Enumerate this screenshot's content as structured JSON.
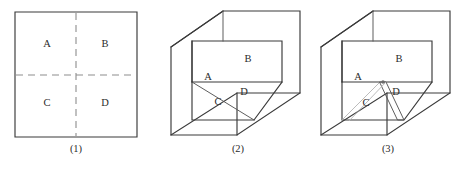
{
  "page": {
    "background_color": "#ffffff",
    "width": 468,
    "height": 169
  },
  "style": {
    "solid_stroke": "#3a3a3a",
    "thin_stroke": "#555555",
    "dashed_stroke": "#8d8d8d",
    "slit_stroke": "#b4b4b4",
    "label_color": "#2b2b2b"
  },
  "figures": [
    {
      "id": "figure-1",
      "caption": "(1)",
      "description": "flat square divided by dashed lines into four quadrants",
      "regions": [
        {
          "key": "A",
          "label": "A",
          "x": 47,
          "y": 45
        },
        {
          "key": "B",
          "label": "B",
          "x": 105,
          "y": 45
        },
        {
          "key": "C",
          "label": "C",
          "x": 47,
          "y": 104
        },
        {
          "key": "D",
          "label": "D",
          "x": 105,
          "y": 104
        }
      ],
      "caption_x": 76,
      "caption_y": 150,
      "outline": "M15,12 L137,12 L137,137 L15,137 Z",
      "fold_lines": [
        "M16,75 L136,75",
        "M76,13 L76,136"
      ]
    },
    {
      "id": "figure-2",
      "caption": "(2)",
      "description": "square folded into an open box, flaps A B C D forming inner corner",
      "regions": [
        {
          "key": "A",
          "label": "A",
          "x": 208,
          "y": 78
        },
        {
          "key": "B",
          "label": "B",
          "x": 248,
          "y": 60
        },
        {
          "key": "C",
          "label": "C",
          "x": 218,
          "y": 103
        },
        {
          "key": "D",
          "label": "D",
          "x": 244,
          "y": 93
        }
      ],
      "caption_x": 238,
      "caption_y": 150,
      "outer_box": [
        "M223,11 L300,11 L300,93 L237,135 L171,135 L171,47 Z",
        "M171,47 L223,11",
        "M171,135 L237,93 L300,93",
        "M237,93 L237,135"
      ],
      "inner_flaps": [
        "M192,41 L282,41 L282,82 L192,82 Z",
        "M192,82 L192,120 L254,120 L282,82",
        "M192,82 L254,120",
        "M192,41 L192,82",
        "M223,11 L223,41"
      ]
    },
    {
      "id": "figure-3",
      "caption": "(3)",
      "description": "same folded box with a narrow slit strip opened between flaps C and D",
      "regions": [
        {
          "key": "A",
          "label": "A",
          "x": 358,
          "y": 78
        },
        {
          "key": "B",
          "label": "B",
          "x": 399,
          "y": 60
        },
        {
          "key": "C",
          "label": "C",
          "x": 366,
          "y": 104
        },
        {
          "key": "D",
          "label": "D",
          "x": 396,
          "y": 93
        }
      ],
      "caption_x": 388,
      "caption_y": 150,
      "outer_box": [
        "M373,11 L450,11 L450,93 L387,135 L321,135 L321,47 Z",
        "M321,47 L373,11",
        "M321,135 L387,93 L450,93",
        "M387,93 L387,135"
      ],
      "inner_flaps": [
        "M342,41 L432,41 L432,82 L342,82 Z",
        "M342,82 L342,120 L404,120 L432,82",
        "M342,41 L342,82",
        "M373,11 L373,41"
      ],
      "slit": {
        "description": "narrow parallelogram strip between C and D",
        "left_edge": "M380,82 L342,120",
        "right_edge": "M386,82 L349,121",
        "strip_fill": "M380,82 L386,82 L404,120 L398,120 Z",
        "top_vertex_x": 383,
        "top_vertex_y": 82
      }
    }
  ]
}
